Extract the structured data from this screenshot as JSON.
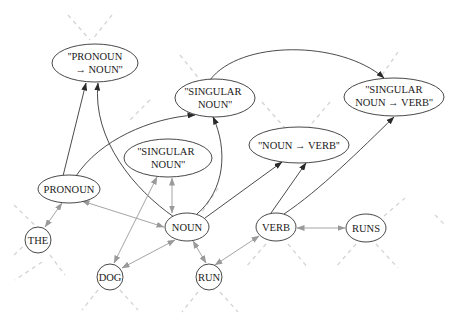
{
  "diagram": {
    "type": "directed-graph",
    "nodes": [
      {
        "id": "pronoun_noun",
        "lines": [
          "''PRONOUN",
          "→ NOUN''"
        ],
        "shape": "ellipse",
        "cx": 95,
        "cy": 63,
        "rx": 43,
        "ry": 19
      },
      {
        "id": "singular_noun_top",
        "lines": [
          "''SINGULAR",
          "NOUN''"
        ],
        "shape": "ellipse",
        "cx": 215,
        "cy": 98,
        "rx": 40,
        "ry": 19
      },
      {
        "id": "singular_noun_verb",
        "lines": [
          "''SINGULAR",
          "NOUN → VERB''"
        ],
        "shape": "ellipse",
        "cx": 394,
        "cy": 97,
        "rx": 50,
        "ry": 19
      },
      {
        "id": "noun_verb",
        "lines": [
          "''NOUN → VERB''"
        ],
        "shape": "ellipse",
        "cx": 299,
        "cy": 145,
        "rx": 50,
        "ry": 18
      },
      {
        "id": "singular_noun_mid",
        "lines": [
          "''SINGULAR",
          "NOUN''"
        ],
        "shape": "ellipse",
        "cx": 168,
        "cy": 158,
        "rx": 44,
        "ry": 19
      },
      {
        "id": "pronoun",
        "lines": [
          "PRONOUN"
        ],
        "shape": "ellipse",
        "cx": 69,
        "cy": 189,
        "rx": 31,
        "ry": 14
      },
      {
        "id": "the",
        "lines": [
          "THE"
        ],
        "shape": "circle",
        "cx": 38,
        "cy": 240,
        "rx": 13,
        "ry": 13
      },
      {
        "id": "noun",
        "lines": [
          "NOUN"
        ],
        "shape": "ellipse",
        "cx": 187,
        "cy": 227,
        "rx": 22,
        "ry": 14
      },
      {
        "id": "dog",
        "lines": [
          "DOG"
        ],
        "shape": "circle",
        "cx": 110,
        "cy": 277,
        "rx": 13,
        "ry": 13
      },
      {
        "id": "run",
        "lines": [
          "RUN"
        ],
        "shape": "circle",
        "cx": 209,
        "cy": 277,
        "rx": 13,
        "ry": 13
      },
      {
        "id": "verb",
        "lines": [
          "VERB"
        ],
        "shape": "ellipse",
        "cx": 276,
        "cy": 227,
        "rx": 20,
        "ry": 14
      },
      {
        "id": "runs",
        "lines": [
          "RUNS"
        ],
        "shape": "ellipse",
        "cx": 366,
        "cy": 228,
        "rx": 20,
        "ry": 14
      }
    ],
    "edges": [
      {
        "from": "pronoun",
        "to": "pronoun_noun",
        "style": "dark",
        "direction": "forward"
      },
      {
        "from": "noun",
        "to": "pronoun_noun",
        "style": "dark",
        "direction": "forward"
      },
      {
        "from": "pronoun",
        "to": "singular_noun_top",
        "style": "dark",
        "direction": "forward"
      },
      {
        "from": "noun",
        "to": "singular_noun_top",
        "style": "dark",
        "direction": "forward"
      },
      {
        "from": "singular_noun_top",
        "to": "singular_noun_verb",
        "style": "dark",
        "direction": "forward"
      },
      {
        "from": "noun",
        "to": "noun_verb",
        "style": "dark",
        "direction": "forward"
      },
      {
        "from": "verb",
        "to": "noun_verb",
        "style": "dark",
        "direction": "forward"
      },
      {
        "from": "verb",
        "to": "singular_noun_verb",
        "style": "dark",
        "direction": "forward"
      },
      {
        "from": "pronoun",
        "to": "the",
        "style": "gray",
        "direction": "both"
      },
      {
        "from": "pronoun",
        "to": "noun",
        "style": "gray",
        "direction": "both"
      },
      {
        "from": "singular_noun_mid",
        "to": "noun",
        "style": "gray",
        "direction": "both"
      },
      {
        "from": "singular_noun_mid",
        "to": "dog",
        "style": "gray",
        "direction": "both"
      },
      {
        "from": "noun",
        "to": "dog",
        "style": "gray",
        "direction": "both"
      },
      {
        "from": "noun",
        "to": "run",
        "style": "gray",
        "direction": "both"
      },
      {
        "from": "run",
        "to": "verb",
        "style": "gray",
        "direction": "both"
      },
      {
        "from": "verb",
        "to": "runs",
        "style": "gray",
        "direction": "both"
      }
    ]
  }
}
